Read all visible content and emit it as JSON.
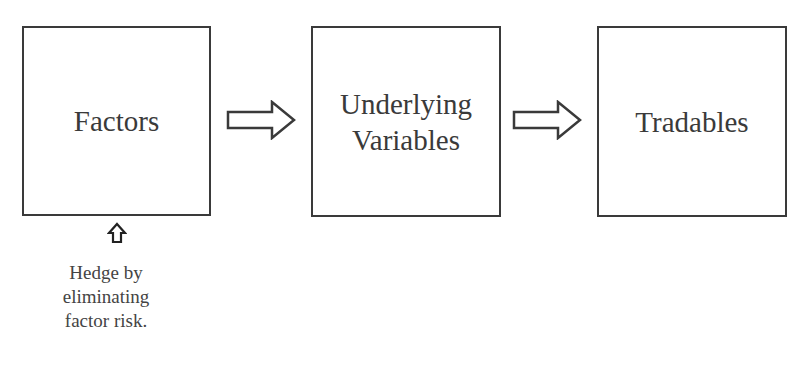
{
  "diagram": {
    "type": "flow",
    "nodes": [
      {
        "id": "factors",
        "label": "Factors"
      },
      {
        "id": "underlying",
        "label": "Underlying\nVariables"
      },
      {
        "id": "tradables",
        "label": "Tradables"
      }
    ],
    "edges": [
      {
        "from": "factors",
        "to": "underlying",
        "icon": "right-block-arrow-icon"
      },
      {
        "from": "underlying",
        "to": "tradables",
        "icon": "right-block-arrow-icon"
      }
    ],
    "annotation": {
      "target": "factors",
      "icon": "up-block-arrow-icon",
      "text": "Hedge by\neliminating\nfactor risk."
    },
    "colors": {
      "stroke": "#3a3a3a",
      "background": "#ffffff"
    }
  }
}
